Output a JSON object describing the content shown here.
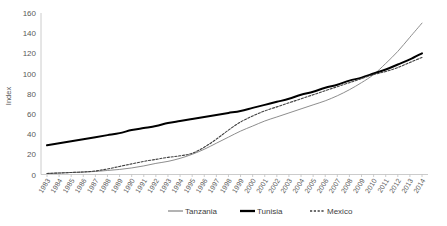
{
  "chart_data": {
    "type": "line",
    "title": "",
    "xlabel": "",
    "ylabel": "Index",
    "ylim": [
      0,
      160
    ],
    "ytick_step": 20,
    "grid": false,
    "legend_position": "bottom",
    "categories": [
      "1983",
      "1984",
      "1985",
      "1986",
      "1987",
      "1988",
      "1989",
      "1990",
      "1991",
      "1992",
      "1993",
      "1994",
      "1995",
      "1996",
      "1997",
      "1998",
      "1999",
      "2000",
      "2001",
      "2002",
      "2003",
      "2004",
      "2005",
      "2006",
      "2007",
      "2008",
      "2009",
      "2010",
      "2011",
      "2012",
      "2013",
      "2014"
    ],
    "yticks": [
      0,
      20,
      40,
      60,
      80,
      100,
      120,
      140,
      160
    ],
    "series": [
      {
        "name": "Tanzania",
        "style": "solid-thin",
        "color": "#808080",
        "values": [
          1,
          1.5,
          2,
          2.5,
          3,
          4,
          5,
          6.5,
          8.5,
          11,
          13,
          16,
          20,
          25,
          31,
          37,
          43,
          48,
          53,
          57,
          61,
          65,
          69,
          73,
          78,
          84,
          91,
          99,
          110,
          122,
          136,
          150
        ]
      },
      {
        "name": "Tunisia",
        "style": "solid-thick",
        "color": "#000000",
        "values": [
          29,
          31,
          33,
          35,
          37,
          39,
          41,
          44,
          46,
          48,
          51,
          53,
          55,
          57,
          59,
          61,
          63,
          66,
          69,
          72,
          75,
          79,
          82,
          86,
          89,
          93,
          96,
          100,
          104,
          109,
          114,
          120
        ]
      },
      {
        "name": "Mexico",
        "style": "dashed",
        "color": "#404040",
        "values": [
          1,
          1.5,
          2,
          2.5,
          3.5,
          5.5,
          8,
          10.5,
          13,
          15,
          17,
          18.5,
          21,
          27,
          35,
          44,
          52,
          58,
          63,
          67,
          71,
          75,
          79,
          83,
          87,
          91,
          95,
          99,
          102,
          106,
          111,
          116
        ]
      }
    ]
  },
  "legend": {
    "items": [
      {
        "label": "Tanzania"
      },
      {
        "label": "Tunisia"
      },
      {
        "label": "Mexico"
      }
    ]
  }
}
